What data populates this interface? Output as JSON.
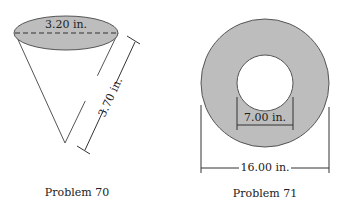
{
  "problem70": {
    "diameter_label": "3.20 in.",
    "slant_label": "3.70 in.",
    "caption": "Problem 70"
  },
  "problem71": {
    "inner_label": "7.00 in.",
    "outer_label": "16.00 in.",
    "caption": "Problem 71"
  },
  "colors": {
    "fill": "#bdbdbd",
    "stroke": "#555555"
  }
}
